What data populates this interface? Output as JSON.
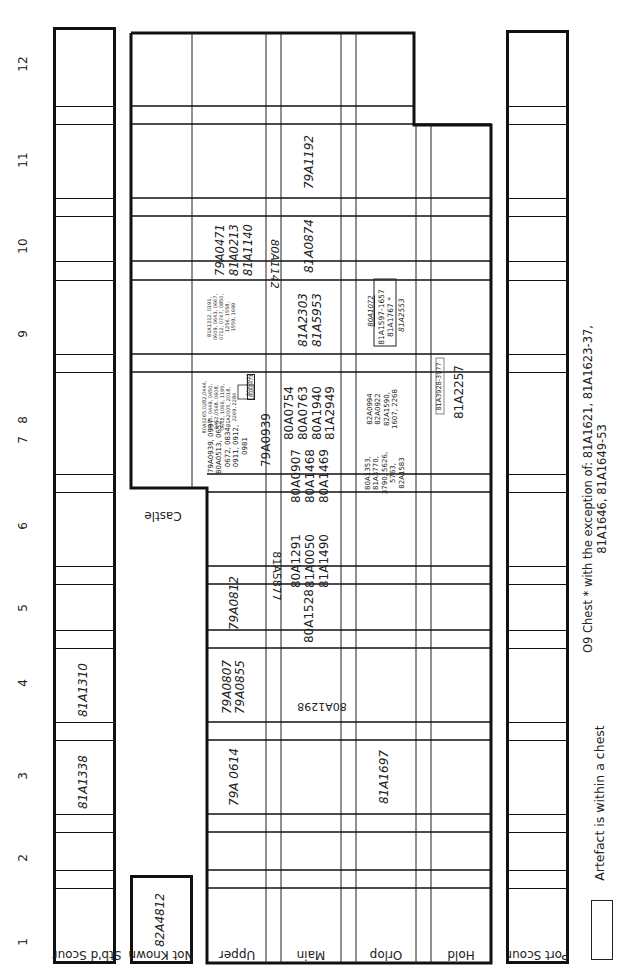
{
  "diagram": {
    "section_numbers": [
      "1",
      "2",
      "3",
      "4",
      "5",
      "6",
      "7",
      "8",
      "9",
      "10",
      "11",
      "12"
    ],
    "decks": {
      "stbd_scour": "Stb'd Scour",
      "not_known": "Not Known",
      "upper": "Upper",
      "main": "Main",
      "orlop": "Orlop",
      "hold": "Hold",
      "port_scour": "Port Scour"
    },
    "castle_label": "Castle",
    "cells": {
      "stbd_3": "81A1338",
      "stbd_4": "81A1310",
      "notknown_1": "82A4812",
      "upper_3": "79A 0614",
      "upper_4": "79A0807\n79A0855",
      "upper_5": "79A0812",
      "upper_7a": "79A0939, 0997\n80A0513, 0652,\n0672, 0834,\n0911, 0912,\n0981",
      "upper_7b": "79A0939",
      "upper_7_chest_a": "80A0451",
      "upper_7_chest_b": "80A0473",
      "upper_8": "80A0265,0282,0444,\n0445, 0449, 0450,\n0452,0548, 0608,\n0642, 1066, 1195,\n81A2005, 2018,\n2269, 2284",
      "upper_9": "81A1312, 0191,\n0609, 0643, 0667,\n0712, 0747, 0850,\n1256, 1558,\n1559, 1699",
      "upper_10": "79A0471\n81A0213\n81A1140",
      "upper_main_3_4": "80A1298",
      "upper_main_5_6": "81A5877",
      "upper_main_8_9": "80A1142",
      "main_5": "80A1528",
      "main_6": "80A1291\n81A0050\n81A1490",
      "main_7": "80A0907\n80A1468\n80A1469",
      "main_8": "80A0754\n80A0763\n80A1940\n81A2949",
      "main_9": "81A2303\n81A5953",
      "main_10": "81A0874",
      "main_11": "79A1192",
      "orlop_3": "81A1697",
      "orlop_7": "80A1353,\n81A3770,\n3790, 5626,\n5763,\n82A1583",
      "orlop_8": "82A0994\n82A0922\n82A1590,\n1607, 2268",
      "orlop_8_chest": "81A3928-3977",
      "orlop_9a": "80A1072",
      "orlop_9_chest": "81A1597-1657\n81A1767 *",
      "orlop_9b": "81A2553",
      "hold_8": "81A2257"
    },
    "legend": {
      "chest_label": "Artefact is within a chest",
      "note": "O9 Chest * with the exception of: 81A1621, 81A1623-37,\n81A1646, 81A1649-53"
    }
  }
}
